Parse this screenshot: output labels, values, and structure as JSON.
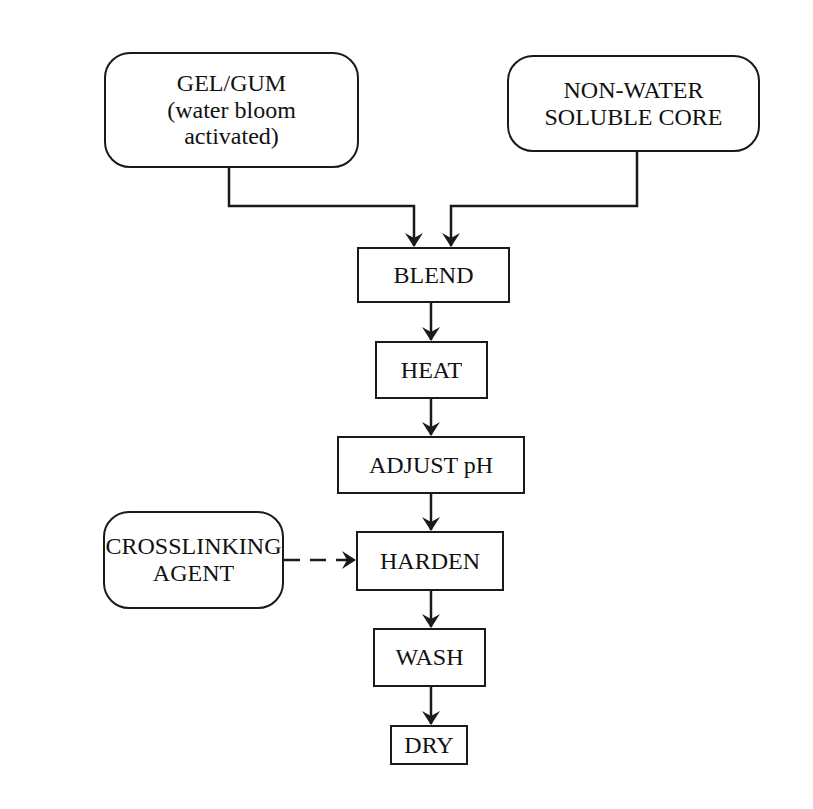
{
  "diagram": {
    "type": "process-flowchart",
    "inputs": [
      {
        "id": "gel_gum",
        "lines": [
          "GEL/GUM",
          "(water bloom",
          "activated)"
        ],
        "shape": "rounded"
      },
      {
        "id": "core",
        "lines": [
          "NON-WATER",
          "SOLUBLE CORE"
        ],
        "shape": "rounded"
      },
      {
        "id": "crosslinker",
        "lines": [
          "CROSSLINKING",
          "AGENT"
        ],
        "shape": "rounded"
      }
    ],
    "steps": [
      {
        "id": "blend",
        "label": "BLEND"
      },
      {
        "id": "heat",
        "label": "HEAT"
      },
      {
        "id": "adjust_ph",
        "label": "ADJUST pH"
      },
      {
        "id": "harden",
        "label": "HARDEN"
      },
      {
        "id": "wash",
        "label": "WASH"
      },
      {
        "id": "dry",
        "label": "DRY"
      }
    ],
    "edges": [
      {
        "from": "gel_gum",
        "to": "blend",
        "style": "solid"
      },
      {
        "from": "core",
        "to": "blend",
        "style": "solid"
      },
      {
        "from": "blend",
        "to": "heat",
        "style": "solid"
      },
      {
        "from": "heat",
        "to": "adjust_ph",
        "style": "solid"
      },
      {
        "from": "adjust_ph",
        "to": "harden",
        "style": "solid"
      },
      {
        "from": "crosslinker",
        "to": "harden",
        "style": "dashed"
      },
      {
        "from": "harden",
        "to": "wash",
        "style": "solid"
      },
      {
        "from": "wash",
        "to": "dry",
        "style": "solid"
      }
    ],
    "colors": {
      "line": "#1a1a1a",
      "background": "#ffffff"
    }
  }
}
